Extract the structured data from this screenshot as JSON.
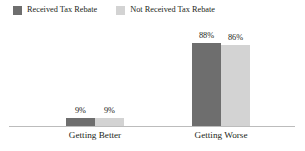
{
  "chart_data": {
    "type": "bar",
    "title": "",
    "subtitle": "",
    "xlabel": "",
    "ylabel": "",
    "ylim": [
      0,
      100
    ],
    "grid": false,
    "legend_position": "top-left",
    "categories": [
      "Getting Better",
      "Getting Worse"
    ],
    "series": [
      {
        "name": "Received Tax Rebate",
        "color": "#6e6e6e",
        "values": [
          9,
          88
        ],
        "labels": [
          "9%",
          "88%"
        ]
      },
      {
        "name": "Not Received Tax Rebate",
        "color": "#d3d3d3",
        "values": [
          9,
          86
        ],
        "labels": [
          "9%",
          "86%"
        ]
      }
    ]
  },
  "legend": {
    "items": [
      {
        "label": "Received Tax Rebate",
        "color": "#6e6e6e"
      },
      {
        "label": "Not Received Tax Rebate",
        "color": "#d3d3d3"
      }
    ]
  },
  "axis": {
    "baseline_color": "#bcbcbc"
  }
}
